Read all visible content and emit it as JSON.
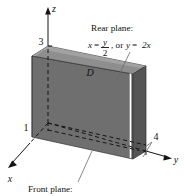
{
  "figure": {
    "axes": {
      "x_label": "x",
      "y_label": "y",
      "z_label": "z"
    },
    "ticks": {
      "z_value": "3",
      "x_value": "1",
      "y_value": "4"
    },
    "region": {
      "label": "D"
    },
    "annotations": {
      "rear_plane_heading": "Rear plane:",
      "rear_plane_eq_lhs": "x",
      "rear_plane_eq_equals": "=",
      "rear_plane_eq_numerator": "y",
      "rear_plane_eq_denominator": "2",
      "rear_plane_eq_tail": ", or y = 2x",
      "rear_plane_eq_tail_or": ", or",
      "rear_plane_eq_tail_y": "y",
      "rear_plane_eq_tail_eq": "=",
      "rear_plane_eq_tail_2x": "2x",
      "front_plane_heading": "Front plane:"
    },
    "colors": {
      "front_face": "#6f6f6f",
      "top_face": "#8c8c8c",
      "left_face": "#5f5f5f",
      "right_face": "#5a5a5a",
      "outline": "#2b2b2b",
      "highlight_edge": "#ffffff",
      "background": "#ffffff",
      "text": "#111111"
    }
  }
}
